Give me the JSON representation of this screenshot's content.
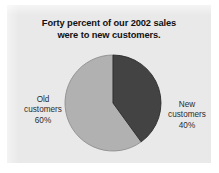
{
  "figure": {
    "kind": "pie-chart-figure",
    "panel_bg": "#e9e9e9",
    "page_bg": "#ffffff"
  },
  "chart_data": {
    "type": "pie",
    "title": "Forty percent of our 2002 sales were to new customers.",
    "title_lines": [
      "Forty percent of our 2002 sales",
      "were to new customers."
    ],
    "categories": [
      "New customers",
      "Old customers"
    ],
    "values": [
      40,
      60
    ],
    "value_unit": "%",
    "slices": [
      {
        "label": "New customers",
        "value": 40,
        "value_text": "40%",
        "color": "#434343",
        "label_lines": [
          "New",
          "customers",
          "40%"
        ],
        "label_position": "right"
      },
      {
        "label": "Old customers",
        "value": 60,
        "value_text": "60%",
        "color": "#b1b1b1",
        "label_lines": [
          "Old",
          "customers",
          "60%"
        ],
        "label_position": "left"
      }
    ],
    "start_angle_deg": 0,
    "direction": "clockwise",
    "legend": "none",
    "grid": false,
    "xlabel": "",
    "ylabel": ""
  }
}
